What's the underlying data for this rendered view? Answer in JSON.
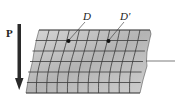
{
  "figure": {
    "type": "shear-deformation-grid",
    "labels": {
      "force": "P",
      "point_original": "D",
      "point_displaced": "D'"
    },
    "grid": {
      "rows": 6,
      "columns": 11
    },
    "colors": {
      "block_fill_light": "#d4d4d4",
      "block_fill_dark": "#a8a8a8",
      "grid_line": "#3a3a3a",
      "arrow": "#2a2a2a",
      "text": "#222222"
    }
  }
}
